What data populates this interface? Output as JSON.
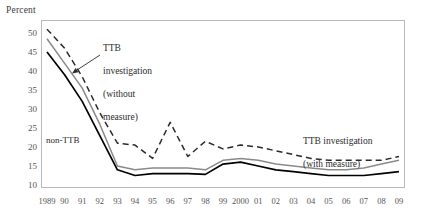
{
  "chart_data": {
    "type": "line",
    "title": "",
    "ylabel": "Percent",
    "xlabel": "",
    "ylim": [
      10,
      50
    ],
    "yticks": [
      50,
      45,
      40,
      35,
      30,
      25,
      20,
      15,
      10
    ],
    "grid": false,
    "legend_position": "inline-annotations",
    "categories": [
      "1989",
      "90",
      "91",
      "92",
      "93",
      "94",
      "95",
      "96",
      "97",
      "98",
      "99",
      "2000",
      "01",
      "02",
      "03",
      "04",
      "05",
      "06",
      "07",
      "08",
      "09"
    ],
    "series": [
      {
        "name": "TTB investigation (without measure)",
        "style": "dashed",
        "color": "#2b2b2b",
        "values": [
          51.0,
          46.0,
          38.5,
          29.0,
          21.0,
          20.5,
          17.0,
          26.5,
          17.5,
          21.5,
          19.5,
          20.5,
          20.0,
          19.0,
          18.0,
          17.0,
          16.5,
          16.5,
          16.5,
          16.5,
          17.5
        ]
      },
      {
        "name": "TTB investigation (with measure)",
        "style": "solid",
        "color": "#8a8a8a",
        "values": [
          48.5,
          42.0,
          35.5,
          26.0,
          15.0,
          14.0,
          14.5,
          14.5,
          14.5,
          14.0,
          16.5,
          17.0,
          16.5,
          15.5,
          15.0,
          14.5,
          14.0,
          14.0,
          14.5,
          15.5,
          16.5
        ]
      },
      {
        "name": "non-TTB",
        "style": "solid",
        "color": "#000000",
        "values": [
          45.0,
          39.0,
          32.0,
          23.0,
          14.0,
          12.5,
          13.0,
          13.0,
          13.0,
          12.8,
          15.5,
          16.0,
          15.0,
          14.0,
          13.5,
          13.0,
          12.5,
          12.5,
          12.5,
          13.0,
          13.5
        ]
      }
    ],
    "annotations": [
      {
        "name": "ttb-without-measure-label",
        "text": "TTB\ninvestigation\n(without\nmeasure)",
        "has_arrow": true
      },
      {
        "name": "non-ttb-label",
        "text": "non-TTB",
        "has_arrow": false
      },
      {
        "name": "ttb-with-measure-label",
        "text": "TTB investigation\n(with measure)",
        "has_arrow": false
      }
    ],
    "colors": {
      "axis": "#b9b9b9",
      "tick_text": "#555555",
      "dashed_series": "#2b2b2b",
      "gray_series": "#8a8a8a",
      "black_series": "#000000"
    }
  },
  "labels": {
    "y_axis_title": "Percent",
    "ann_without_measure_l1": "TTB",
    "ann_without_measure_l2": "investigation",
    "ann_without_measure_l3": "(without",
    "ann_without_measure_l4": "measure)",
    "ann_non_ttb": "non-TTB",
    "ann_with_measure_l1": "TTB investigation",
    "ann_with_measure_l2": "(with measure)"
  }
}
